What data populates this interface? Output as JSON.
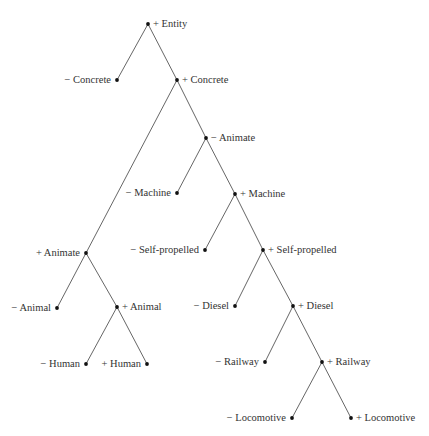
{
  "diagram": {
    "type": "binary-feature-tree",
    "nodes": [
      {
        "id": "entity",
        "label": "+ Entity",
        "x": 148,
        "y": 24,
        "side": "right"
      },
      {
        "id": "neg-concrete",
        "label": "− Concrete",
        "x": 117,
        "y": 80,
        "side": "left"
      },
      {
        "id": "pos-concrete",
        "label": "+ Concrete",
        "x": 177,
        "y": 80,
        "side": "right"
      },
      {
        "id": "neg-animate",
        "label": "− Animate",
        "x": 206,
        "y": 138,
        "side": "right"
      },
      {
        "id": "neg-machine",
        "label": "− Machine",
        "x": 177,
        "y": 193,
        "side": "left"
      },
      {
        "id": "pos-machine",
        "label": "+ Machine",
        "x": 235,
        "y": 194,
        "side": "right"
      },
      {
        "id": "pos-animate",
        "label": "+ Animate",
        "x": 86,
        "y": 253,
        "side": "left"
      },
      {
        "id": "neg-self-propelled",
        "label": "− Self-propelled",
        "x": 205,
        "y": 250,
        "side": "left"
      },
      {
        "id": "pos-self-propelled",
        "label": "+ Self-propelled",
        "x": 263,
        "y": 250,
        "side": "right"
      },
      {
        "id": "neg-animal",
        "label": "− Animal",
        "x": 57,
        "y": 308,
        "side": "left"
      },
      {
        "id": "pos-animal",
        "label": "+ Animal",
        "x": 117,
        "y": 307,
        "side": "right"
      },
      {
        "id": "neg-diesel",
        "label": "− Diesel",
        "x": 235,
        "y": 306,
        "side": "left"
      },
      {
        "id": "pos-diesel",
        "label": "+ Diesel",
        "x": 293,
        "y": 306,
        "side": "right"
      },
      {
        "id": "neg-human",
        "label": "− Human",
        "x": 86,
        "y": 364,
        "side": "left"
      },
      {
        "id": "pos-human",
        "label": "+ Human",
        "x": 147,
        "y": 364,
        "side": "left"
      },
      {
        "id": "neg-railway",
        "label": "− Railway",
        "x": 265,
        "y": 362,
        "side": "left"
      },
      {
        "id": "pos-railway",
        "label": "+ Railway",
        "x": 322,
        "y": 362,
        "side": "right"
      },
      {
        "id": "neg-locomotive",
        "label": "− Locomotive",
        "x": 292,
        "y": 418,
        "side": "left"
      },
      {
        "id": "pos-locomotive",
        "label": "+ Locomotive",
        "x": 351,
        "y": 418,
        "side": "right"
      }
    ],
    "edges": [
      [
        "entity",
        "neg-concrete"
      ],
      [
        "entity",
        "pos-concrete"
      ],
      [
        "pos-concrete",
        "pos-animate"
      ],
      [
        "pos-concrete",
        "neg-animate"
      ],
      [
        "neg-animate",
        "neg-machine"
      ],
      [
        "neg-animate",
        "pos-machine"
      ],
      [
        "pos-machine",
        "neg-self-propelled"
      ],
      [
        "pos-machine",
        "pos-self-propelled"
      ],
      [
        "pos-animate",
        "neg-animal"
      ],
      [
        "pos-animate",
        "pos-animal"
      ],
      [
        "pos-animal",
        "neg-human"
      ],
      [
        "pos-animal",
        "pos-human"
      ],
      [
        "pos-self-propelled",
        "neg-diesel"
      ],
      [
        "pos-self-propelled",
        "pos-diesel"
      ],
      [
        "pos-diesel",
        "neg-railway"
      ],
      [
        "pos-diesel",
        "pos-railway"
      ],
      [
        "pos-railway",
        "neg-locomotive"
      ],
      [
        "pos-railway",
        "pos-locomotive"
      ]
    ]
  }
}
